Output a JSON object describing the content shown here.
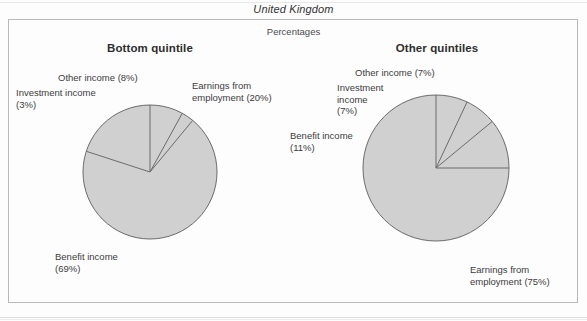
{
  "figure": {
    "country_title": "United Kingdom",
    "units_label": "Percentages"
  },
  "panels": [
    {
      "heading": "Bottom quintile"
    },
    {
      "heading": "Other quintiles"
    }
  ],
  "labels": {
    "left": {
      "earnings": "Earnings from\nemployment (20%)",
      "benefit": "Benefit income\n(69%)",
      "investment": "Investment income\n(3%)",
      "other": "Other income (8%)"
    },
    "right": {
      "earnings": "Earnings from\nemployment (75%)",
      "benefit": "Benefit income\n(11%)",
      "investment": "Investment\nincome\n(7%)",
      "other": "Other income (7%)"
    }
  },
  "style": {
    "slice_fill": "#d0d0d0",
    "slice_stroke": "#6b6b6b",
    "frame_color": "#b9b9b9",
    "text_color": "#3c3c3c"
  },
  "chart_data": [
    {
      "type": "pie",
      "title": "Bottom quintile",
      "subtitle": "Percentages",
      "supertitle": "United Kingdom",
      "unit": "percent",
      "start_angle_deg": 0,
      "direction": "counterclockwise",
      "center": [
        150,
        172
      ],
      "radius": 67,
      "categories": [
        "Earnings from employment",
        "Benefit income",
        "Investment income",
        "Other income"
      ],
      "values": [
        20,
        69,
        3,
        8
      ],
      "labels": [
        "Earnings from employment (20%)",
        "Benefit income (69%)",
        "Investment income (3%)",
        "Other income (8%)"
      ],
      "legend": "none"
    },
    {
      "type": "pie",
      "title": "Other quintiles",
      "subtitle": "Percentages",
      "supertitle": "United Kingdom",
      "unit": "percent",
      "start_angle_deg": 0,
      "direction": "counterclockwise",
      "center": [
        436,
        168
      ],
      "radius": 73,
      "categories": [
        "Earnings from employment",
        "Benefit income",
        "Investment income",
        "Other income"
      ],
      "values": [
        75,
        11,
        7,
        7
      ],
      "labels": [
        "Earnings from employment (75%)",
        "Benefit income (11%)",
        "Investment income (7%)",
        "Other income (7%)"
      ],
      "legend": "none"
    }
  ]
}
